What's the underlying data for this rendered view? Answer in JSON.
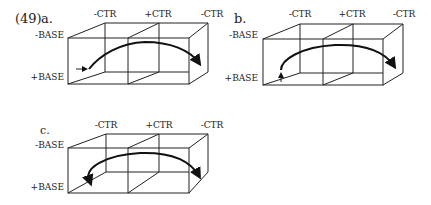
{
  "example_number": "(49)",
  "panels": [
    {
      "id": "a",
      "label": "a.",
      "ctr_labels": [
        "-CTR",
        "+CTR",
        "-CTR"
      ],
      "base_labels": [
        "-BASE",
        "+BASE"
      ],
      "start_marker": "right-arrow",
      "path": "from +BASE/-CTR arcing over +CTR to +BASE/-CTR (right)"
    },
    {
      "id": "b",
      "label": "b.",
      "ctr_labels": [
        "-CTR",
        "+CTR",
        "-CTR"
      ],
      "base_labels": [
        "-BASE",
        "+BASE"
      ],
      "start_marker": "up-arrow",
      "path": "from +BASE/-CTR arcing over +CTR to +BASE/-CTR (right)"
    },
    {
      "id": "c",
      "label": "c.",
      "ctr_labels": [
        "-CTR",
        "+CTR",
        "-CTR"
      ],
      "base_labels": [
        "-BASE",
        "+BASE"
      ],
      "start_marker": "none",
      "path": "double-headed arc between +BASE/-CTR (left) and +BASE/-CTR (right)"
    }
  ]
}
